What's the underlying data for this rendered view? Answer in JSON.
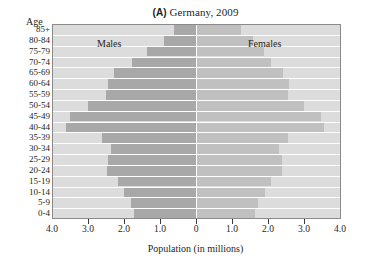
{
  "figure": {
    "title_tag": "(A)",
    "title_text": " Germany, 2009",
    "age_axis_label": "Age",
    "x_axis_title": "Population (in millions)",
    "males_label": "Males",
    "females_label": "Females"
  },
  "colors": {
    "plot_background": "#dcdcdc",
    "male_bar": "#a8a8a8",
    "female_bar": "#c0c0c0",
    "gridline": "#ffffff",
    "text": "#231f20"
  },
  "chart_data": {
    "type": "bar",
    "title": "(A) Germany, 2009",
    "subtitle": "",
    "xlabel": "Population (in millions)",
    "ylabel": "Age",
    "orientation": "horizontal",
    "layout": "population-pyramid",
    "grid": true,
    "legend_position": "in-plot",
    "xlim": [
      -4.0,
      4.0
    ],
    "xticks_left": [
      "4.0",
      "3.0",
      "2.0",
      "1.0"
    ],
    "xtick_center": "0",
    "xticks_right": [
      "1.0",
      "2.0",
      "3.0",
      "4.0"
    ],
    "xtick_values": [
      -4.0,
      -3.0,
      -2.0,
      -1.0,
      0,
      1.0,
      2.0,
      3.0,
      4.0
    ],
    "categories": [
      "85+",
      "80-84",
      "75-79",
      "70-74",
      "65-69",
      "60-64",
      "55-59",
      "50-54",
      "45-49",
      "40-44",
      "35-39",
      "30-34",
      "25-29",
      "20-24",
      "15-19",
      "10-14",
      "5-9",
      "0-4"
    ],
    "series": [
      {
        "name": "Males",
        "side": "left",
        "values": [
          0.6,
          0.88,
          1.35,
          1.78,
          2.28,
          2.45,
          2.5,
          3.0,
          3.5,
          3.62,
          2.6,
          2.35,
          2.45,
          2.48,
          2.18,
          2.0,
          1.8,
          1.72
        ]
      },
      {
        "name": "Females",
        "side": "right",
        "values": [
          1.22,
          1.55,
          1.85,
          2.05,
          2.38,
          2.55,
          2.52,
          2.98,
          3.45,
          3.52,
          2.52,
          2.28,
          2.35,
          2.35,
          2.05,
          1.9,
          1.7,
          1.62
        ]
      }
    ]
  }
}
